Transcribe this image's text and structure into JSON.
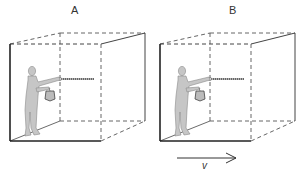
{
  "panels": [
    {
      "label": "A",
      "description": "Person holding a spring scale with a hanging weight inside a stationary box"
    },
    {
      "label": "B",
      "description": "Person holding a spring scale with a hanging weight inside a box moving with velocity v"
    }
  ],
  "velocity": {
    "label": "v",
    "direction": "right"
  },
  "colors": {
    "line": "#444444",
    "figure": "#c4c4c4",
    "figure_outline": "#888888"
  }
}
